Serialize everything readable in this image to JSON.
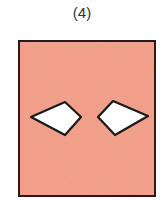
{
  "figure": {
    "label": "(4)",
    "background_color": "#ffffff",
    "panel": {
      "fill_color": "#ef9a84",
      "border_color": "#2b1a17",
      "x": 19,
      "y": 41,
      "width": 136,
      "height": 155
    },
    "shapes": [
      {
        "name": "left-kite",
        "fill_color": "#ffffff",
        "stroke_color": "#1a1a1a",
        "points": "31,117 65,102 81,117 65,135"
      },
      {
        "name": "right-kite",
        "fill_color": "#ffffff",
        "stroke_color": "#1a1a1a",
        "points": "98,117 113,101 148,116 115,135"
      }
    ]
  }
}
